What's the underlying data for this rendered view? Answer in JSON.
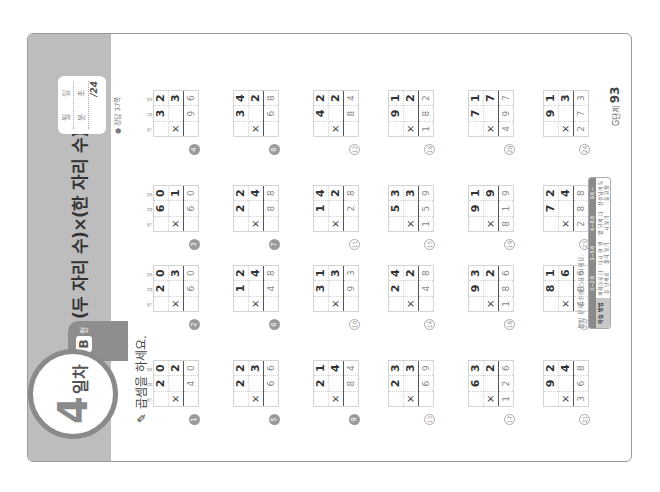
{
  "page": {
    "day_number": "4",
    "day_label": "일차",
    "level_badge": "B",
    "level_suffix": "형",
    "title": "(두 자리 수)×(한 자리 수)(1)",
    "date_box": {
      "month_label": "월",
      "day_label": "일",
      "minute_label": "분",
      "second_label": "초",
      "score": "/24"
    },
    "answer_reference": "● 정답 37쪽",
    "instruction": "곱셈을 하세요.",
    "place_labels": [
      "백",
      "십",
      "일"
    ],
    "problems": [
      {
        "num": "1",
        "a": [
          "",
          "2",
          "0"
        ],
        "b": [
          "×",
          "",
          "2"
        ],
        "ans": [
          "",
          "4",
          "0"
        ]
      },
      {
        "num": "2",
        "a": [
          "",
          "2",
          "0"
        ],
        "b": [
          "×",
          "",
          "3"
        ],
        "ans": [
          "",
          "6",
          "0"
        ]
      },
      {
        "num": "3",
        "a": [
          "",
          "6",
          "0"
        ],
        "b": [
          "×",
          "",
          "1"
        ],
        "ans": [
          "",
          "6",
          "0"
        ]
      },
      {
        "num": "4",
        "a": [
          "",
          "3",
          "2"
        ],
        "b": [
          "×",
          "",
          "3"
        ],
        "ans": [
          "",
          "9",
          "6"
        ]
      },
      {
        "num": "5",
        "a": [
          "",
          "2",
          "2"
        ],
        "b": [
          "×",
          "",
          "3"
        ],
        "ans": [
          "",
          "6",
          "6"
        ]
      },
      {
        "num": "6",
        "a": [
          "",
          "1",
          "2"
        ],
        "b": [
          "×",
          "",
          "4"
        ],
        "ans": [
          "",
          "4",
          "8"
        ]
      },
      {
        "num": "7",
        "a": [
          "",
          "2",
          "2"
        ],
        "b": [
          "×",
          "",
          "4"
        ],
        "ans": [
          "",
          "8",
          "8"
        ]
      },
      {
        "num": "8",
        "a": [
          "",
          "3",
          "4"
        ],
        "b": [
          "×",
          "",
          "2"
        ],
        "ans": [
          "",
          "6",
          "8"
        ]
      },
      {
        "num": "9",
        "a": [
          "",
          "2",
          "1"
        ],
        "b": [
          "×",
          "",
          "4"
        ],
        "ans": [
          "",
          "8",
          "4"
        ]
      },
      {
        "num": "10",
        "a": [
          "",
          "3",
          "1"
        ],
        "b": [
          "×",
          "",
          "3"
        ],
        "ans": [
          "",
          "9",
          "3"
        ]
      },
      {
        "num": "11",
        "a": [
          "",
          "1",
          "4"
        ],
        "b": [
          "×",
          "",
          "2"
        ],
        "ans": [
          "",
          "2",
          "8"
        ]
      },
      {
        "num": "12",
        "a": [
          "",
          "4",
          "2"
        ],
        "b": [
          "×",
          "",
          "2"
        ],
        "ans": [
          "",
          "8",
          "4"
        ]
      },
      {
        "num": "13",
        "a": [
          "",
          "2",
          "3"
        ],
        "b": [
          "×",
          "",
          "3"
        ],
        "ans": [
          "",
          "6",
          "9"
        ]
      },
      {
        "num": "14",
        "a": [
          "",
          "2",
          "4"
        ],
        "b": [
          "×",
          "",
          "2"
        ],
        "ans": [
          "",
          "4",
          "8"
        ]
      },
      {
        "num": "15",
        "a": [
          "",
          "5",
          "3"
        ],
        "b": [
          "×",
          "",
          "3"
        ],
        "ans": [
          "1",
          "5",
          "9"
        ]
      },
      {
        "num": "16",
        "a": [
          "",
          "9",
          "1"
        ],
        "b": [
          "×",
          "",
          "2"
        ],
        "ans": [
          "1",
          "8",
          "2"
        ]
      },
      {
        "num": "17",
        "a": [
          "",
          "6",
          "3"
        ],
        "b": [
          "×",
          "",
          "2"
        ],
        "ans": [
          "1",
          "2",
          "6"
        ]
      },
      {
        "num": "18",
        "a": [
          "",
          "9",
          "3"
        ],
        "b": [
          "×",
          "",
          "2"
        ],
        "ans": [
          "1",
          "8",
          "6"
        ]
      },
      {
        "num": "19",
        "a": [
          "",
          "9",
          "1"
        ],
        "b": [
          "×",
          "",
          "9"
        ],
        "ans": [
          "8",
          "1",
          "9"
        ]
      },
      {
        "num": "20",
        "a": [
          "",
          "7",
          "1"
        ],
        "b": [
          "×",
          "",
          "7"
        ],
        "ans": [
          "4",
          "9",
          "7"
        ]
      },
      {
        "num": "21",
        "a": [
          "",
          "9",
          "2"
        ],
        "b": [
          "×",
          "",
          "4"
        ],
        "ans": [
          "3",
          "6",
          "8"
        ]
      },
      {
        "num": "22",
        "a": [
          "",
          "8",
          "1"
        ],
        "b": [
          "×",
          "",
          "6"
        ],
        "ans": [
          "4",
          "8",
          "6"
        ]
      },
      {
        "num": "23",
        "a": [
          "",
          "7",
          "2"
        ],
        "b": [
          "×",
          "",
          "4"
        ],
        "ans": [
          "2",
          "8",
          "8"
        ]
      },
      {
        "num": "24",
        "a": [
          "",
          "9",
          "1"
        ],
        "b": [
          "×",
          "",
          "3"
        ],
        "ans": [
          "2",
          "7",
          "3"
        ]
      }
    ],
    "footer": {
      "legend_caption": "틀린 문제 수에 ○표 하세요.",
      "legend": [
        {
          "head": "",
          "body": "학습 방법"
        },
        {
          "head": "0~2개",
          "body": "계획대로 다음 단계로"
        },
        {
          "head": "3~5개",
          "body": "다시 한 번 풀어 보기"
        },
        {
          "head": "6~8개",
          "body": "앞 단계 다시 보기"
        },
        {
          "head": "9개~",
          "body": "선생님께 도움 요청"
        }
      ],
      "book_label": "G단계",
      "page_number": "93"
    }
  }
}
